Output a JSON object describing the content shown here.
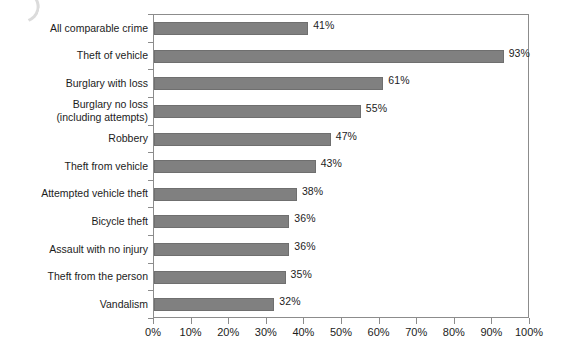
{
  "chart_data": {
    "type": "bar",
    "orientation": "horizontal",
    "title": "",
    "xlabel": "",
    "ylabel": "",
    "xlim": [
      0,
      100
    ],
    "grid": false,
    "legend": null,
    "value_suffix": "%",
    "categories": [
      "All comparable crime",
      "Theft of vehicle",
      "Burglary with loss",
      "Burglary no loss\n(including attempts)",
      "Robbery",
      "Theft from vehicle",
      "Attempted vehicle theft",
      "Bicycle theft",
      "Assault with no injury",
      "Theft from the person",
      "Vandalism"
    ],
    "values": [
      41,
      93,
      61,
      55,
      47,
      43,
      38,
      36,
      36,
      35,
      32
    ],
    "value_labels": [
      "41%",
      "93%",
      "61%",
      "55%",
      "47%",
      "43%",
      "38%",
      "36%",
      "36%",
      "35%",
      "32%"
    ],
    "xticks": [
      0,
      10,
      20,
      30,
      40,
      50,
      60,
      70,
      80,
      90,
      100
    ],
    "xticklabels": [
      "0%",
      "10%",
      "20%",
      "30%",
      "40%",
      "50%",
      "60%",
      "70%",
      "80%",
      "90%",
      "100%"
    ],
    "colors": {
      "bar_fill": "#808080",
      "bar_border": "#6f6f6f",
      "axis": "#8c8c8c",
      "text": "#1c1c1c",
      "background": "#ffffff"
    }
  }
}
